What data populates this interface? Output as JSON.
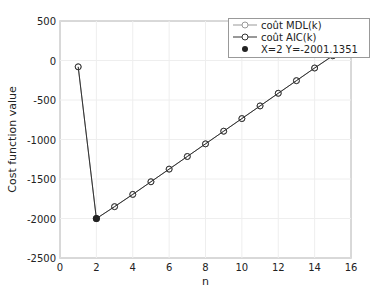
{
  "chart_data": {
    "type": "line",
    "xlabel": "n",
    "ylabel": "Cost function value",
    "xlim": [
      0,
      16
    ],
    "ylim": [
      -2500,
      500
    ],
    "xticks": [
      0,
      2,
      4,
      6,
      8,
      10,
      12,
      14,
      16
    ],
    "yticks": [
      500,
      0,
      -500,
      -1000,
      -1500,
      -2000,
      -2500
    ],
    "x": [
      1,
      2,
      3,
      4,
      5,
      6,
      7,
      8,
      9,
      10,
      11,
      12,
      13,
      14,
      15,
      16
    ],
    "series": [
      {
        "name": "coût MDL(k)",
        "color": "#999999",
        "values": [
          -80,
          -2001,
          -1850,
          -1695,
          -1535,
          -1375,
          -1215,
          -1055,
          -895,
          -735,
          -575,
          -415,
          -255,
          -95,
          60,
          210
        ]
      },
      {
        "name": "coût AIC(k)",
        "color": "#333333",
        "values": [
          -80,
          -2001,
          -1850,
          -1695,
          -1535,
          -1375,
          -1215,
          -1055,
          -895,
          -735,
          -575,
          -415,
          -255,
          -95,
          60,
          210
        ]
      }
    ],
    "annotation": {
      "label": "X=2  Y=-2001.1351",
      "x": 2,
      "y": -2001.1351
    },
    "grid": true,
    "legend_position": "top-right"
  },
  "legend": {
    "items": [
      "coût MDL(k)",
      "coût AIC(k)",
      "X=2  Y=-2001.1351"
    ]
  }
}
